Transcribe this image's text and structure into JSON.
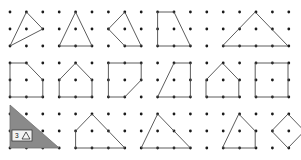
{
  "figure": {
    "width": 301,
    "height": 160,
    "background_color": "#ffffff",
    "dot_color": "#1a1a1a",
    "stroke_color": "#4a4a4a",
    "fill_color": "#8a8a8a"
  },
  "grid": {
    "origin_x": 10,
    "origin_y": 12,
    "spacing_x": 16.4,
    "spacing_y": 17.0,
    "columns": 18,
    "rows": 9,
    "dot_radius": 1.4
  },
  "badge": {
    "number": "3",
    "glyph_name": "triangle-glyph",
    "x": 12,
    "y": 130,
    "width": 20,
    "height": 11
  },
  "shapes": [
    {
      "id": "r1c1",
      "name": "triangle-obtuse",
      "row": 1,
      "column": 1,
      "sides": 3,
      "closed": true,
      "points": "26.4,12 42.8,29 10,46"
    },
    {
      "id": "r1c2",
      "name": "triangle-isosceles",
      "row": 1,
      "column": 2,
      "sides": 3,
      "closed": true,
      "points": "75.6,12 92,46 59.2,46"
    },
    {
      "id": "r1c3",
      "name": "quadrilateral-kite",
      "row": 1,
      "column": 3,
      "sides": 4,
      "closed": true,
      "points": "124.8,12 141.2,46 124.8,46 108.4,29"
    },
    {
      "id": "r1c4",
      "name": "trapezoid-right",
      "row": 1,
      "column": 4,
      "sides": 4,
      "closed": true,
      "points": "157.6,12 174,12 190.4,46 157.6,46"
    },
    {
      "id": "r1c5",
      "name": "triangle-wide-isosceles",
      "row": 1,
      "column": 5,
      "sides": 3,
      "closed": true,
      "points": "255.2,12 288,46 222.4,46"
    },
    {
      "id": "r2c1",
      "name": "pentagon-irregular",
      "row": 2,
      "column": 1,
      "sides": 5,
      "closed": true,
      "points": "10,63 26.4,63 42.8,80 42.8,97 10,97"
    },
    {
      "id": "r2c2",
      "name": "pentagon-tilted",
      "row": 2,
      "column": 2,
      "sides": 5,
      "closed": true,
      "points": "75.6,63 92,80 92,97 59.2,97 59.2,80"
    },
    {
      "id": "r2c3",
      "name": "pentagon-notched",
      "row": 2,
      "column": 3,
      "sides": 5,
      "closed": true,
      "points": "108.4,63 141.2,63 141.2,80 124.8,97 108.4,97"
    },
    {
      "id": "r2c4",
      "name": "quadrilateral-slanted",
      "row": 2,
      "column": 4,
      "sides": 4,
      "closed": true,
      "points": "174,63 190.4,63 190.4,97 157.6,97"
    },
    {
      "id": "r2c5",
      "name": "pentagon-house",
      "row": 2,
      "column": 5,
      "sides": 5,
      "closed": true,
      "points": "222.4,63 238.8,80 238.8,97 206,97 206,80"
    },
    {
      "id": "r2c6",
      "name": "square",
      "row": 2,
      "column": 6,
      "sides": 4,
      "closed": true,
      "points": "255.2,63 288,63 288,97 255.2,97"
    },
    {
      "id": "r3c1",
      "name": "triangle-filled-right",
      "row": 3,
      "column": 1,
      "sides": 3,
      "closed": true,
      "filled": true,
      "points": "10,105 10,148 59.2,148"
    },
    {
      "id": "r3c2",
      "name": "quadrilateral-trapezoid",
      "row": 3,
      "column": 2,
      "sides": 4,
      "closed": true,
      "points": "92,114 124.8,148 75.6,148 75.6,131"
    },
    {
      "id": "r3c3",
      "name": "triangle-scalene",
      "row": 3,
      "column": 3,
      "sides": 3,
      "closed": true,
      "points": "157.6,114 190.4,148 141.2,148"
    },
    {
      "id": "r3c4",
      "name": "quadrilateral-irregular",
      "row": 3,
      "column": 4,
      "sides": 4,
      "closed": true,
      "points": "238.8,114 255.2,131 255.2,148 222.4,148"
    },
    {
      "id": "r3c5",
      "name": "diamond-rhombus",
      "row": 3,
      "column": 5,
      "sides": 4,
      "closed": true,
      "points": "288,114 304.4,131 288,148 271.6,131"
    }
  ]
}
